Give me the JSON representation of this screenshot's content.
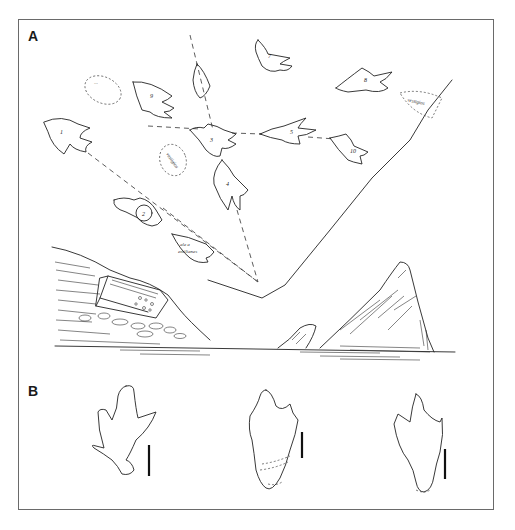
{
  "figure": {
    "panels": [
      {
        "label": "A",
        "description": "Map sketch of footprint trackway with numbered prints radiating from a convergence point, above a landscape drawing of a rocky shore with boulders and a pyramidal rock"
      },
      {
        "label": "B",
        "description": "Three tridactyl footprint outlines each with a vertical scale bar"
      }
    ],
    "footprints_A": [
      {
        "id": "1",
        "label": "1"
      },
      {
        "id": "2",
        "label": "2"
      },
      {
        "id": "3",
        "label": "3"
      },
      {
        "id": "4",
        "label": "4"
      },
      {
        "id": "5",
        "label": "5"
      },
      {
        "id": "7",
        "label": "7"
      },
      {
        "id": "8",
        "label": "8"
      },
      {
        "id": "9",
        "label": "9"
      },
      {
        "id": "10",
        "label": "10"
      }
    ],
    "annotations_A": {
      "dotted_ellipse_top_left": "···",
      "dotted_ellipse_center": "vestigios",
      "dotted_region_right": "vestigios",
      "print_lower_label_line1": "ale a",
      "print_lower_label_line2": "emilianes"
    },
    "footprints_B_count": 3,
    "caption_partial": "",
    "colors": {
      "ink": "#222222",
      "frame": "#6a6a6a",
      "background": "#ffffff"
    }
  }
}
